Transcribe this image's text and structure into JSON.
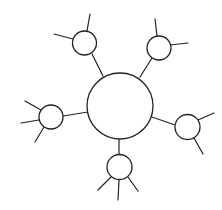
{
  "diagram": {
    "type": "hub-and-spoke",
    "colors": {
      "stroke": "#222222",
      "fill": "#ffffff",
      "background": "#ffffff"
    },
    "hub": {
      "id": "hub",
      "cx": 120,
      "cy": 106,
      "r": 33
    },
    "satellites": [
      {
        "id": "top-left",
        "cx": 84.5,
        "cy": 43,
        "r": 12,
        "connector": [
          92,
          54,
          103,
          76
        ],
        "spokes": [
          [
            87,
            31,
            90,
            14
          ],
          [
            73,
            39,
            54,
            34
          ]
        ]
      },
      {
        "id": "top-right",
        "cx": 159,
        "cy": 48,
        "r": 12,
        "connector": [
          152,
          58,
          140,
          77
        ],
        "spokes": [
          [
            157,
            36,
            155,
            19
          ],
          [
            170,
            45,
            188,
            43
          ]
        ]
      },
      {
        "id": "left",
        "cx": 51,
        "cy": 117,
        "r": 12,
        "connector": [
          63,
          116,
          88,
          112
        ],
        "spokes": [
          [
            41,
            110,
            25,
            101
          ],
          [
            39,
            120,
            21,
            123
          ],
          [
            44,
            127,
            35,
            142
          ]
        ]
      },
      {
        "id": "right",
        "cx": 187.5,
        "cy": 127,
        "r": 12.5,
        "connector": [
          175,
          125,
          152,
          117
        ],
        "spokes": [
          [
            198,
            120,
            214,
            113
          ],
          [
            194,
            138,
            203,
            154
          ]
        ]
      },
      {
        "id": "bottom",
        "cx": 119.5,
        "cy": 167,
        "r": 12.5,
        "connector": [
          119,
          154,
          119,
          139
        ],
        "spokes": [
          [
            111,
            177,
            98,
            190
          ],
          [
            119,
            180,
            118,
            200
          ],
          [
            128,
            177,
            138,
            191
          ]
        ]
      }
    ]
  }
}
